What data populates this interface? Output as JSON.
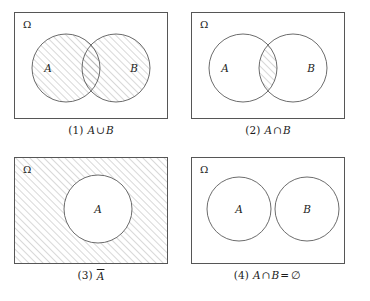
{
  "figure": {
    "background_color": "#ffffff",
    "stroke_color": "#555555",
    "hatch_color": "#8a8a8a",
    "text_color": "#1c1c1c"
  },
  "panels": [
    {
      "id": "panel-1",
      "universe_label": "Ω",
      "circles": [
        {
          "label": "A",
          "cx": 66,
          "cy": 68,
          "r": 34
        },
        {
          "label": "B",
          "cx": 116,
          "cy": 68,
          "r": 34
        }
      ],
      "shaded_region": "union",
      "caption": {
        "index": "(1)",
        "left": "A",
        "operator": "∪",
        "right": "B",
        "equals": "",
        "result": ""
      }
    },
    {
      "id": "panel-2",
      "universe_label": "Ω",
      "circles": [
        {
          "label": "A",
          "cx": 243,
          "cy": 68,
          "r": 34
        },
        {
          "label": "B",
          "cx": 293,
          "cy": 68,
          "r": 34
        }
      ],
      "shaded_region": "intersection",
      "caption": {
        "index": "(2)",
        "left": "A",
        "operator": "∩",
        "right": "B",
        "equals": "",
        "result": ""
      }
    },
    {
      "id": "panel-3",
      "universe_label": "Ω",
      "circles": [
        {
          "label": "A",
          "cx": 98,
          "cy": 209,
          "r": 34
        }
      ],
      "shaded_region": "complement",
      "caption": {
        "index": "(3)",
        "left": "A",
        "operator": "",
        "right": "",
        "equals": "",
        "result": "",
        "overline": true
      }
    },
    {
      "id": "panel-4",
      "universe_label": "Ω",
      "circles": [
        {
          "label": "A",
          "cx": 239,
          "cy": 209,
          "r": 32
        },
        {
          "label": "B",
          "cx": 307,
          "cy": 209,
          "r": 32
        }
      ],
      "shaded_region": "none",
      "caption": {
        "index": "(4)",
        "left": "A",
        "operator": "∩",
        "right": "B",
        "equals": "=",
        "result": "∅"
      }
    }
  ]
}
